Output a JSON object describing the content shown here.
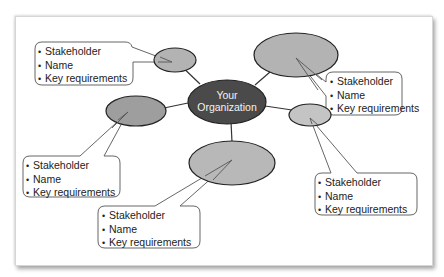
{
  "diagram": {
    "type": "stakeholder-map",
    "center": {
      "line1": "Your",
      "line2": "Organization",
      "fill": "#4a4a4a"
    },
    "stakeholder_fill": "#b3b3b3",
    "stakeholder_fill_light": "#c4c4c4",
    "callouts": [
      {
        "id": "top-left",
        "items": [
          "Stakeholder",
          "Name",
          "Key requirements"
        ]
      },
      {
        "id": "right-top",
        "items": [
          "Stakeholder",
          "Name",
          "Key requirements"
        ]
      },
      {
        "id": "left-mid",
        "items": [
          "Stakeholder",
          "Name",
          "Key requirements"
        ]
      },
      {
        "id": "bottom-right",
        "items": [
          "Stakeholder",
          "Name",
          "Key requirements"
        ]
      },
      {
        "id": "bottom-mid",
        "items": [
          "Stakeholder",
          "Name",
          "Key requirements"
        ]
      }
    ]
  }
}
